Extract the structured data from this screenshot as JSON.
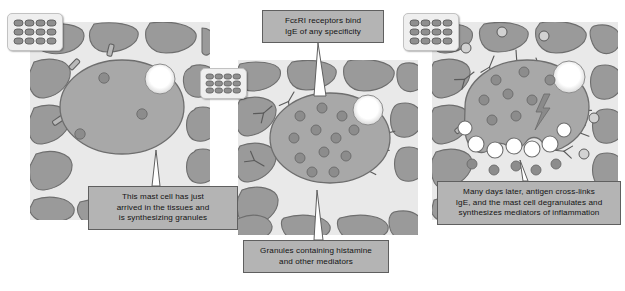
{
  "figure": {
    "background_color": "#ffffff",
    "panel_count": 3
  },
  "colors": {
    "tissue_background": "#e9e9e9",
    "tissue_cell": "#9a9a9a",
    "tissue_cell_stroke": "#6e6e6e",
    "mast_cell_body": "#a8a8a8",
    "mast_cell_stroke": "#6e6e6e",
    "granule": "#8c8c8c",
    "granule_stroke": "#6a6a6a",
    "nucleus_glow": "#ffffff",
    "receptor": "#b9b9b9",
    "receptor_stroke": "#5f5f5f",
    "ige_antibody": "#c2c2c2",
    "ige_stroke": "#5a5a5a",
    "antigen": "#d2d2d2",
    "vesicle": "#ffffff",
    "lightning": "#8a8a8a",
    "label_fill": "#b4b4b4",
    "label_border": "#5f5f5f",
    "label_text": "#131313",
    "badge_fill": "#efefef",
    "badge_border": "#c2c2c2",
    "badge_cell": "#8f8f8f"
  },
  "labels": [
    {
      "id": "label-mast-cell-arrival",
      "name": "label-mast-cell-arrival",
      "text": "This mast cell has just arrived in the tissues and is synthesizing granules",
      "lines": [
        "This mast cell has just",
        "arrived in the tissues and",
        "is synthesizing granules"
      ],
      "position": {
        "left": 88,
        "top": 186,
        "width": 150,
        "height": 44
      },
      "leader": "up"
    },
    {
      "id": "label-fceri-receptors",
      "name": "label-fceri-receptors",
      "text": "FcεRI receptors bind IgE of any specificity",
      "lines": [
        "FcεRI receptors bind",
        "IgE of any specificity"
      ],
      "position": {
        "left": 262,
        "top": 10,
        "width": 122,
        "height": 33
      },
      "leader": "down"
    },
    {
      "id": "label-granules-histamine",
      "name": "label-granules-histamine",
      "text": "Granules containing histamine and other mediators",
      "lines": [
        "Granules containing histamine",
        "and other mediators"
      ],
      "position": {
        "left": 243,
        "top": 240,
        "width": 146,
        "height": 33
      },
      "leader": "up"
    },
    {
      "id": "label-antigen-crosslink",
      "name": "label-antigen-crosslink",
      "text": "Many days later, antigen cross-links IgE, and the mast cell degranulates and synthesizes mediators of inflammation",
      "lines": [
        "Many days later, antigen cross-links",
        "IgE, and the mast cell degranulates and",
        "synthesizes mediators of inflammation"
      ],
      "position": {
        "left": 437,
        "top": 181,
        "width": 184,
        "height": 44
      },
      "leader": "up"
    }
  ],
  "badges": [
    {
      "id": "badge-tissue-1",
      "name": "tissue-grid-icon",
      "position": {
        "left": 7,
        "top": 13,
        "width": 56,
        "height": 38
      },
      "cols": 4,
      "rows": 3
    },
    {
      "id": "badge-tissue-2",
      "name": "tissue-grid-icon",
      "position": {
        "left": 200,
        "top": 68,
        "width": 47,
        "height": 31
      },
      "cols": 4,
      "rows": 3
    },
    {
      "id": "badge-tissue-3",
      "name": "tissue-grid-icon",
      "position": {
        "left": 403,
        "top": 13,
        "width": 56,
        "height": 38
      },
      "cols": 4,
      "rows": 3
    }
  ],
  "panels": [
    {
      "id": "panel-1",
      "name": "panel-mast-cell-arrival",
      "stage": 1,
      "caption_ref": "label-mast-cell-arrival",
      "position": {
        "left": 30,
        "top": 22,
        "width": 180,
        "height": 198
      },
      "cell": {
        "cx": 92,
        "cy": 85,
        "rx": 62,
        "ry": 47
      },
      "nucleus": {
        "cx": 130,
        "cy": 57,
        "r": 15
      },
      "granule_count": 3,
      "receptor_count": 7,
      "ige_count": 0,
      "antigen_count": 0,
      "degranulating": false
    },
    {
      "id": "panel-2",
      "name": "panel-ige-sensitized",
      "stage": 2,
      "caption_ref": "label-fceri-receptors",
      "position": {
        "left": 238,
        "top": 60,
        "width": 180,
        "height": 175
      },
      "cell": {
        "cx": 92,
        "cy": 78,
        "rx": 60,
        "ry": 45
      },
      "nucleus": {
        "cx": 130,
        "cy": 50,
        "r": 15
      },
      "granule_count": 12,
      "receptor_count": 0,
      "ige_count": 7,
      "antigen_count": 0,
      "degranulating": false
    },
    {
      "id": "panel-3",
      "name": "panel-degranulation",
      "stage": 3,
      "caption_ref": "label-antigen-crosslink",
      "position": {
        "left": 432,
        "top": 22,
        "width": 186,
        "height": 198
      },
      "cell": {
        "cx": 95,
        "cy": 85,
        "rx": 62,
        "ry": 47
      },
      "nucleus": {
        "cx": 137,
        "cy": 55,
        "r": 16
      },
      "granule_count": 13,
      "receptor_count": 2,
      "ige_count": 7,
      "antigen_count": 5,
      "degranulating": true,
      "vesicle_count": 7,
      "lightning": true
    }
  ]
}
